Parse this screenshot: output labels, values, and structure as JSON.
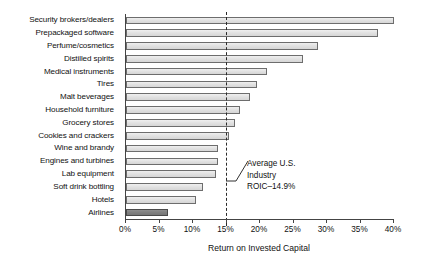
{
  "chart_data": {
    "type": "bar",
    "orientation": "horizontal",
    "title": "",
    "xlabel": "Return on Invested Capital",
    "ylabel": "",
    "xlim": [
      0,
      40
    ],
    "xtick_labels": [
      "0%",
      "5%",
      "10%",
      "15%",
      "20%",
      "25%",
      "30%",
      "35%",
      "40%"
    ],
    "xticks": [
      0,
      5,
      10,
      15,
      20,
      25,
      30,
      35,
      40
    ],
    "grid": false,
    "legend": null,
    "categories": [
      "Security brokers/dealers",
      "Prepackaged software",
      "Perfume/cosmetics",
      "Distilled spirits",
      "Medical instruments",
      "Tires",
      "Malt beverages",
      "Household furniture",
      "Grocery stores",
      "Cookies and crackers",
      "Wine and brandy",
      "Engines and turbines",
      "Lab equipment",
      "Soft drink bottling",
      "Hotels",
      "Airlines"
    ],
    "values": [
      40.9,
      37.6,
      28.6,
      26.4,
      21.0,
      19.5,
      18.5,
      17.0,
      16.3,
      15.4,
      13.7,
      13.7,
      13.4,
      11.5,
      10.4,
      6.3
    ],
    "highlight_category": "Airlines",
    "annotations": [
      {
        "name": "average-roic",
        "text_lines": [
          "Average U.S.",
          "Industry",
          "ROIC–14.9%"
        ],
        "value": 14.9,
        "line_style": "dashed"
      }
    ],
    "colors": {
      "bar_fill": "#e3e3e3",
      "bar_edge": "#6d6d6d",
      "highlight_fill": "#808080",
      "axis": "#444444",
      "text": "#111111"
    }
  }
}
